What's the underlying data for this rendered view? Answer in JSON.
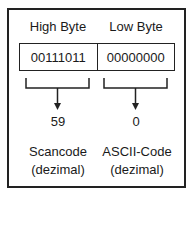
{
  "diagram": {
    "headers": {
      "high": "High Byte",
      "low": "Low Byte"
    },
    "bytes": {
      "high": "00111011",
      "low": "00000000"
    },
    "values": {
      "high": "59",
      "low": "0"
    },
    "labels": {
      "high_line1": "Scancode",
      "high_line2": "(dezimal)",
      "low_line1": "ASCII-Code",
      "low_line2": "(dezimal)"
    }
  }
}
